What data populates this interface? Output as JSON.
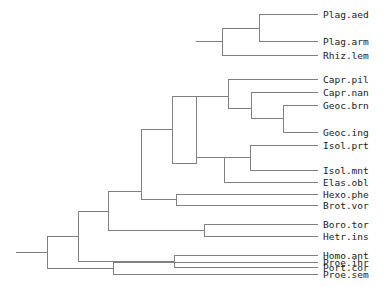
{
  "figure": {
    "kind": "phylogenetic-tree",
    "background_color": "#ffffff",
    "stroke_color": "#808080",
    "stroke_width": 1,
    "label_color": "#1a1a1a",
    "label_font_size": 9.5,
    "width": 391,
    "height": 287
  },
  "chart_data": {
    "type": "tree",
    "title": "",
    "xlabel": "",
    "ylabel": "",
    "orientation": "left-to-right",
    "leaf_count": 19,
    "leaf_labels": [
      "Plag.aed",
      "Plag.arm",
      "Rhiz.lem",
      "Capr.pil",
      "Capr.nan",
      "Geoc.brn",
      "Geoc.ing",
      "Isol.prt",
      "Isol.mnt",
      "Elas.obl",
      "Hexo.phe",
      "Brot.vor",
      "Boro.tor",
      "Hetr.ins",
      "Homo.ant",
      "Port.cor",
      "Proe.ihr",
      "Proe.sem"
    ],
    "newick": "((((((Plag.aed,Plag.arm),Rhiz.lem),((Capr.pil,(Capr.nan,(Geoc.brn,Geoc.ing)))),(((Isol.prt,Isol.mnt),Elas.obl),Hexo.phe,Brot.vor)),(Boro.tor,Hetr.ins)),(Homo.ant,Port.cor)),(Proe.ihr,Proe.sem));",
    "tips": [
      {
        "label": "Plag.aed",
        "x": 320,
        "y": 15,
        "branch_x": 259
      },
      {
        "label": "Plag.arm",
        "x": 320,
        "y": 40,
        "branch_x": 259
      },
      {
        "label": "Rhiz.lem",
        "x": 320,
        "y": 54,
        "branch_x": 222
      },
      {
        "label": "Capr.pil",
        "x": 320,
        "y": 78,
        "branch_x": 228
      },
      {
        "label": "Capr.nan",
        "x": 320,
        "y": 92,
        "branch_x": 251
      },
      {
        "label": "Geoc.brn",
        "x": 320,
        "y": 105,
        "branch_x": 283
      },
      {
        "label": "Geoc.ing",
        "x": 320,
        "y": 131,
        "branch_x": 283
      },
      {
        "label": "Isol.prt",
        "x": 320,
        "y": 144,
        "branch_x": 250
      },
      {
        "label": "Isol.mnt",
        "x": 320,
        "y": 169,
        "branch_x": 250
      },
      {
        "label": "Elas.obl",
        "x": 320,
        "y": 181,
        "branch_x": 224
      },
      {
        "label": "Hexo.phe",
        "x": 320,
        "y": 193,
        "branch_x": 176
      },
      {
        "label": "Brot.vor",
        "x": 320,
        "y": 205,
        "branch_x": 176
      },
      {
        "label": "Boro.tor",
        "x": 320,
        "y": 224,
        "branch_x": 204
      },
      {
        "label": "Hetr.ins",
        "x": 320,
        "y": 236,
        "branch_x": 204
      },
      {
        "label": "Homo.ant",
        "x": 320,
        "y": 255,
        "branch_x": 174
      },
      {
        "label": "Port.cor",
        "x": 320,
        "y": 266,
        "branch_x": 174
      },
      {
        "label": "Proe.ihr",
        "x": 320,
        "y": 284,
        "branch_x": 113
      },
      {
        "label": "Proe.sem",
        "x": 320,
        "y": 296,
        "branch_x": 113
      }
    ]
  },
  "tree_layout": {
    "label_x": 323,
    "tip_line_end_x": 318,
    "root_stub": {
      "x1": 16,
      "x2": 47,
      "y": 252
    },
    "leaves": [
      {
        "label": "Plag.aed",
        "y": 14,
        "from_x": 259
      },
      {
        "label": "Plag.arm",
        "y": 41,
        "from_x": 259
      },
      {
        "label": "Rhiz.lem",
        "y": 55,
        "from_x": 222
      },
      {
        "label": "Capr.pil",
        "y": 79,
        "from_x": 228
      },
      {
        "label": "Capr.nan",
        "y": 92,
        "from_x": 251
      },
      {
        "label": "Geoc.brn",
        "y": 105,
        "from_x": 283
      },
      {
        "label": "Geoc.ing",
        "y": 132,
        "from_x": 283
      },
      {
        "label": "Isol.prt",
        "y": 145,
        "from_x": 250
      },
      {
        "label": "Isol.mnt",
        "y": 170,
        "from_x": 250
      },
      {
        "label": "Elas.obl",
        "y": 182,
        "from_x": 224
      },
      {
        "label": "Hexo.phe",
        "y": 194,
        "from_x": 176
      },
      {
        "label": "Brot.vor",
        "y": 205,
        "from_x": 176
      },
      {
        "label": "Boro.tor",
        "y": 224,
        "from_x": 204
      },
      {
        "label": "Hetr.ins",
        "y": 236,
        "from_x": 204
      },
      {
        "label": "Homo.ant",
        "y": 255,
        "from_x": 174
      },
      {
        "label": "Port.cor",
        "y": 267,
        "from_x": 174
      },
      {
        "label": "Proe.ihr",
        "y": 262,
        "from_x": 113
      },
      {
        "label": "Proe.sem",
        "y": 274,
        "from_x": 113
      }
    ],
    "horizontal_edges": [
      {
        "name": "root-stub",
        "x1": 16,
        "x2": 47,
        "y": 252
      },
      {
        "name": "proe-ihr-tip",
        "x1": 113,
        "x2": 318,
        "y": 262
      },
      {
        "name": "proe-sem-tip",
        "x1": 113,
        "x2": 318,
        "y": 274
      },
      {
        "name": "node-proe-in",
        "x1": 47,
        "x2": 113,
        "y": 268
      },
      {
        "name": "node-rest-in",
        "x1": 47,
        "x2": 78,
        "y": 236
      },
      {
        "name": "homo-ant-tip",
        "x1": 174,
        "x2": 318,
        "y": 255
      },
      {
        "name": "port-cor-tip",
        "x1": 174,
        "x2": 318,
        "y": 267
      },
      {
        "name": "node-homoport-in",
        "x1": 78,
        "x2": 174,
        "y": 261
      },
      {
        "name": "node-upper-in",
        "x1": 78,
        "x2": 108,
        "y": 211
      },
      {
        "name": "boro-tor-tip",
        "x1": 204,
        "x2": 318,
        "y": 224
      },
      {
        "name": "hetr-ins-tip",
        "x1": 204,
        "x2": 318,
        "y": 236
      },
      {
        "name": "node-borohetr-in",
        "x1": 108,
        "x2": 204,
        "y": 230
      },
      {
        "name": "node-core-in",
        "x1": 108,
        "x2": 141,
        "y": 191
      },
      {
        "name": "hexo-phe-tip",
        "x1": 176,
        "x2": 318,
        "y": 194
      },
      {
        "name": "brot-vor-tip",
        "x1": 176,
        "x2": 318,
        "y": 205
      },
      {
        "name": "node-hexbrot-in",
        "x1": 141,
        "x2": 176,
        "y": 199
      },
      {
        "name": "node-abc-in",
        "x1": 141,
        "x2": 172,
        "y": 129
      },
      {
        "name": "node-c-in",
        "x1": 172,
        "x2": 196,
        "y": 163
      },
      {
        "name": "elas-obl-tip",
        "x1": 224,
        "x2": 318,
        "y": 182
      },
      {
        "name": "node-isol-in",
        "x1": 196,
        "x2": 224,
        "y": 157
      },
      {
        "name": "isol-mnt-tip",
        "x1": 250,
        "x2": 318,
        "y": 170
      },
      {
        "name": "isol-prt-tip",
        "x1": 250,
        "x2": 318,
        "y": 145
      },
      {
        "name": "node-isolpair-in",
        "x1": 224,
        "x2": 250,
        "y": 157
      },
      {
        "name": "node-ab-in",
        "x1": 172,
        "x2": 196,
        "y": 96
      },
      {
        "name": "node-b-in",
        "x1": 196,
        "x2": 228,
        "y": 96
      },
      {
        "name": "capr-pil-tip",
        "x1": 228,
        "x2": 318,
        "y": 79
      },
      {
        "name": "node-capnan-in",
        "x1": 228,
        "x2": 251,
        "y": 108
      },
      {
        "name": "capr-nan-tip",
        "x1": 251,
        "x2": 318,
        "y": 92
      },
      {
        "name": "node-geoc-in",
        "x1": 251,
        "x2": 283,
        "y": 118
      },
      {
        "name": "geoc-brn-tip",
        "x1": 283,
        "x2": 318,
        "y": 105
      },
      {
        "name": "geoc-ing-tip",
        "x1": 283,
        "x2": 318,
        "y": 132
      },
      {
        "name": "node-a-in",
        "x1": 196,
        "x2": 222,
        "y": 41
      },
      {
        "name": "rhiz-lem-tip",
        "x1": 222,
        "x2": 318,
        "y": 55
      },
      {
        "name": "node-plag-in",
        "x1": 222,
        "x2": 259,
        "y": 28
      },
      {
        "name": "plag-aed-tip",
        "x1": 259,
        "x2": 318,
        "y": 14
      },
      {
        "name": "plag-arm-tip",
        "x1": 259,
        "x2": 318,
        "y": 41
      }
    ],
    "vertical_edges": [
      {
        "name": "root-split",
        "x": 47,
        "y1": 236,
        "y2": 268
      },
      {
        "name": "proe-split",
        "x": 113,
        "y1": 262,
        "y2": 274
      },
      {
        "name": "rest-split",
        "x": 78,
        "y1": 211,
        "y2": 261
      },
      {
        "name": "homoport-split",
        "x": 174,
        "y1": 255,
        "y2": 267
      },
      {
        "name": "upper-split",
        "x": 108,
        "y1": 191,
        "y2": 230
      },
      {
        "name": "borohetr-split",
        "x": 204,
        "y1": 224,
        "y2": 236
      },
      {
        "name": "core-split",
        "x": 141,
        "y1": 129,
        "y2": 199
      },
      {
        "name": "hexbrot-split",
        "x": 176,
        "y1": 194,
        "y2": 205
      },
      {
        "name": "abc-split",
        "x": 172,
        "y1": 96,
        "y2": 163
      },
      {
        "name": "c-split",
        "x": 196,
        "y1": 96,
        "y2": 163
      },
      {
        "name": "isol-split",
        "x": 224,
        "y1": 157,
        "y2": 182
      },
      {
        "name": "isolpair-split",
        "x": 250,
        "y1": 145,
        "y2": 170
      },
      {
        "name": "b-split",
        "x": 228,
        "y1": 79,
        "y2": 108
      },
      {
        "name": "capnan-split",
        "x": 251,
        "y1": 92,
        "y2": 118
      },
      {
        "name": "geoc-split",
        "x": 283,
        "y1": 105,
        "y2": 132
      },
      {
        "name": "a-split",
        "x": 222,
        "y1": 28,
        "y2": 55
      },
      {
        "name": "plag-split",
        "x": 259,
        "y1": 14,
        "y2": 41
      }
    ]
  }
}
